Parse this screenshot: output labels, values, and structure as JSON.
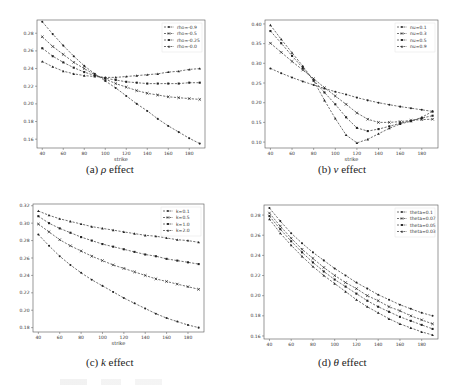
{
  "captions": {
    "a": {
      "label": "(a)",
      "symbol": "ρ",
      "text": "effect"
    },
    "b": {
      "label": "(b)",
      "symbol": "ν",
      "text": "effect"
    },
    "c": {
      "label": "(c)",
      "symbol": "k",
      "text": "effect"
    },
    "d": {
      "label": "(d)",
      "symbol": "θ",
      "text": "effect"
    }
  },
  "chart_data": [
    {
      "id": "a",
      "type": "line",
      "title": "",
      "xlabel": "strike",
      "ylabel": "",
      "x": [
        40,
        50,
        60,
        70,
        80,
        90,
        100,
        110,
        120,
        130,
        140,
        150,
        160,
        170,
        180,
        190
      ],
      "xticks": [
        40,
        60,
        80,
        100,
        120,
        140,
        160,
        180
      ],
      "yticks": [
        0.16,
        0.18,
        0.2,
        0.22,
        0.24,
        0.26,
        0.28
      ],
      "ylim": [
        0.15,
        0.295
      ],
      "xlim": [
        35,
        195
      ],
      "legend_position": "upper right",
      "grid": false,
      "series": [
        {
          "name": "rho=-0.9",
          "marker": "circle",
          "values": [
            0.293,
            0.279,
            0.266,
            0.254,
            0.243,
            0.234,
            0.226,
            0.218,
            0.209,
            0.2,
            0.192,
            0.183,
            0.175,
            0.168,
            0.161,
            0.155
          ]
        },
        {
          "name": "rho=-0.5",
          "marker": "x",
          "values": [
            0.276,
            0.265,
            0.256,
            0.247,
            0.24,
            0.233,
            0.228,
            0.223,
            0.219,
            0.215,
            0.212,
            0.21,
            0.208,
            0.207,
            0.206,
            0.205
          ]
        },
        {
          "name": "rho=-0.25",
          "marker": "square",
          "values": [
            0.263,
            0.254,
            0.247,
            0.241,
            0.236,
            0.232,
            0.229,
            0.227,
            0.225,
            0.224,
            0.223,
            0.223,
            0.223,
            0.223,
            0.224,
            0.224
          ]
        },
        {
          "name": "rho=-0.0",
          "marker": "triangle",
          "values": [
            0.248,
            0.242,
            0.237,
            0.234,
            0.232,
            0.231,
            0.23,
            0.23,
            0.231,
            0.232,
            0.233,
            0.234,
            0.236,
            0.237,
            0.239,
            0.24
          ]
        }
      ]
    },
    {
      "id": "b",
      "type": "line",
      "title": "",
      "xlabel": "strike",
      "ylabel": "",
      "x": [
        40,
        50,
        60,
        70,
        80,
        90,
        100,
        110,
        120,
        130,
        140,
        150,
        160,
        170,
        180,
        190
      ],
      "xticks": [
        40,
        60,
        80,
        100,
        120,
        140,
        160,
        180
      ],
      "yticks": [
        0.1,
        0.15,
        0.2,
        0.25,
        0.3,
        0.35,
        0.4
      ],
      "ylim": [
        0.085,
        0.41
      ],
      "xlim": [
        35,
        195
      ],
      "legend_position": "upper right",
      "grid": false,
      "series": [
        {
          "name": "nu=0.1",
          "marker": "circle",
          "values": [
            0.287,
            0.275,
            0.264,
            0.254,
            0.245,
            0.236,
            0.228,
            0.221,
            0.213,
            0.206,
            0.2,
            0.195,
            0.19,
            0.186,
            0.182,
            0.178
          ]
        },
        {
          "name": "nu=0.3",
          "marker": "x",
          "values": [
            0.351,
            0.328,
            0.305,
            0.283,
            0.261,
            0.238,
            0.217,
            0.196,
            0.174,
            0.158,
            0.15,
            0.15,
            0.152,
            0.155,
            0.157,
            0.158
          ]
        },
        {
          "name": "nu=0.5",
          "marker": "square",
          "values": [
            0.382,
            0.351,
            0.319,
            0.288,
            0.257,
            0.226,
            0.196,
            0.163,
            0.136,
            0.128,
            0.133,
            0.14,
            0.148,
            0.154,
            0.161,
            0.167
          ]
        },
        {
          "name": "nu=0.9",
          "marker": "triangle",
          "values": [
            0.397,
            0.361,
            0.327,
            0.293,
            0.256,
            0.206,
            0.16,
            0.118,
            0.098,
            0.107,
            0.121,
            0.135,
            0.146,
            0.153,
            0.163,
            0.178
          ]
        }
      ]
    },
    {
      "id": "c",
      "type": "line",
      "title": "",
      "xlabel": "strike",
      "ylabel": "",
      "x": [
        40,
        50,
        60,
        70,
        80,
        90,
        100,
        110,
        120,
        130,
        140,
        150,
        160,
        170,
        180,
        190
      ],
      "xticks": [
        40,
        60,
        80,
        100,
        120,
        140,
        160,
        180
      ],
      "yticks": [
        0.18,
        0.2,
        0.22,
        0.24,
        0.26,
        0.28,
        0.3,
        0.32
      ],
      "ylim": [
        0.175,
        0.322
      ],
      "xlim": [
        35,
        195
      ],
      "legend_position": "upper right",
      "grid": false,
      "series": [
        {
          "name": "k=0.1",
          "marker": "circle",
          "values": [
            0.287,
            0.274,
            0.262,
            0.252,
            0.243,
            0.235,
            0.228,
            0.221,
            0.214,
            0.208,
            0.202,
            0.196,
            0.191,
            0.187,
            0.183,
            0.18
          ]
        },
        {
          "name": "k=0.5",
          "marker": "x",
          "values": [
            0.299,
            0.29,
            0.281,
            0.274,
            0.268,
            0.262,
            0.257,
            0.252,
            0.248,
            0.244,
            0.24,
            0.236,
            0.233,
            0.23,
            0.227,
            0.224
          ]
        },
        {
          "name": "k=1.0",
          "marker": "square",
          "values": [
            0.308,
            0.3,
            0.294,
            0.289,
            0.284,
            0.28,
            0.276,
            0.273,
            0.27,
            0.267,
            0.264,
            0.262,
            0.259,
            0.257,
            0.255,
            0.253
          ]
        },
        {
          "name": "k=2.0",
          "marker": "triangle",
          "values": [
            0.314,
            0.309,
            0.305,
            0.302,
            0.299,
            0.296,
            0.294,
            0.292,
            0.29,
            0.288,
            0.286,
            0.285,
            0.283,
            0.281,
            0.28,
            0.278
          ]
        }
      ]
    },
    {
      "id": "d",
      "type": "line",
      "title": "",
      "xlabel": "",
      "ylabel": "",
      "x": [
        40,
        50,
        60,
        70,
        80,
        90,
        100,
        110,
        120,
        130,
        140,
        150,
        160,
        170,
        180,
        190
      ],
      "xticks": [
        40,
        60,
        80,
        100,
        120,
        140,
        160,
        180
      ],
      "yticks": [
        0.16,
        0.18,
        0.2,
        0.22,
        0.24,
        0.26,
        0.28
      ],
      "ylim": [
        0.157,
        0.29
      ],
      "xlim": [
        35,
        195
      ],
      "legend_position": "upper right",
      "grid": false,
      "series": [
        {
          "name": "theta=0.1",
          "marker": "circle",
          "values": [
            0.287,
            0.274,
            0.262,
            0.252,
            0.243,
            0.235,
            0.227,
            0.22,
            0.213,
            0.207,
            0.201,
            0.196,
            0.191,
            0.187,
            0.183,
            0.18
          ]
        },
        {
          "name": "theta=0.07",
          "marker": "x",
          "values": [
            0.282,
            0.269,
            0.257,
            0.246,
            0.237,
            0.228,
            0.22,
            0.213,
            0.207,
            0.2,
            0.195,
            0.189,
            0.185,
            0.18,
            0.176,
            0.172
          ]
        },
        {
          "name": "theta=0.05",
          "marker": "square",
          "values": [
            0.279,
            0.266,
            0.254,
            0.243,
            0.233,
            0.224,
            0.216,
            0.209,
            0.202,
            0.195,
            0.189,
            0.184,
            0.179,
            0.175,
            0.171,
            0.167
          ]
        },
        {
          "name": "theta=0.03",
          "marker": "triangle",
          "values": [
            0.276,
            0.262,
            0.25,
            0.239,
            0.229,
            0.22,
            0.212,
            0.204,
            0.196,
            0.189,
            0.183,
            0.177,
            0.172,
            0.168,
            0.164,
            0.161
          ]
        }
      ]
    }
  ]
}
